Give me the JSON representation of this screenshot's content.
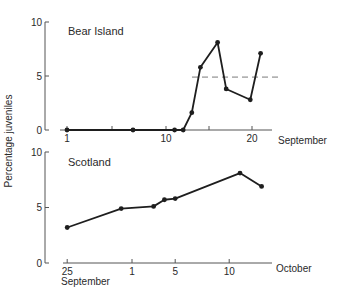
{
  "chart_data": [
    {
      "type": "line",
      "panel_label": "Bear Island",
      "xlabel": "September",
      "ylabel": "Percentage juveniles",
      "ylim": [
        0,
        10
      ],
      "yticks": [
        0,
        5,
        10
      ],
      "xticks": [
        {
          "label": "1",
          "day": 1
        },
        {
          "label": "",
          "day": 6
        },
        {
          "label": "10",
          "day": 10
        },
        {
          "label": "",
          "day": 15
        },
        {
          "label": "20",
          "day": 20
        }
      ],
      "series": [
        {
          "name": "Bear Island",
          "x": [
            1,
            7,
            11,
            12,
            13,
            14,
            16,
            17,
            19.8,
            21
          ],
          "values": [
            0,
            0,
            0,
            0,
            1.6,
            5.8,
            8.1,
            3.8,
            2.8,
            7.1
          ]
        }
      ],
      "reference_line": {
        "style": "dashed",
        "value": 4.9,
        "x_from": 12.5,
        "x_to": 22.5
      },
      "grid": false
    },
    {
      "type": "line",
      "panel_label": "Scotland",
      "xlabel": "October",
      "xlabel_start": "September",
      "ylabel": "Percentage juveniles",
      "ylim": [
        0,
        10
      ],
      "yticks": [
        0,
        5,
        10
      ],
      "xticks": [
        {
          "label": "25",
          "day": -6
        },
        {
          "label": "1",
          "day": 0
        },
        {
          "label": "5",
          "day": 4
        },
        {
          "label": "10",
          "day": 9
        }
      ],
      "series": [
        {
          "name": "Scotland",
          "x": [
            -6,
            -1,
            2,
            3,
            4,
            10,
            12
          ],
          "x_dates": [
            "Sep 25",
            "Sep 30",
            "Oct 3",
            "Oct 4",
            "Oct 5",
            "Oct 11",
            "Oct 13"
          ],
          "values": [
            3.2,
            4.9,
            5.1,
            5.7,
            5.8,
            8.1,
            6.9
          ]
        }
      ],
      "grid": false
    }
  ],
  "labels": {
    "ylabel": "Percentage juveniles",
    "top_panel": "Bear Island",
    "top_xlabel": "September",
    "bottom_panel": "Scotland",
    "bottom_xlabel": "October",
    "bottom_xlabel_start": "September"
  },
  "colors": {
    "line": "#1e1e1e",
    "axis": "#555555",
    "dashed": "#7a7a7a"
  }
}
